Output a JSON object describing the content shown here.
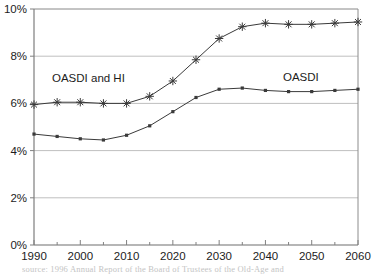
{
  "chart_data": {
    "type": "line",
    "title": "",
    "subtitle": "",
    "xlabel": "",
    "ylabel": "",
    "xlim": [
      1990,
      2060
    ],
    "ylim": [
      0,
      10
    ],
    "grid": true,
    "grid_axis": "y",
    "legend": "inline-annotations",
    "x": [
      1990,
      1995,
      2000,
      2005,
      2010,
      2015,
      2020,
      2025,
      2030,
      2035,
      2040,
      2045,
      2050,
      2055,
      2060
    ],
    "series": [
      {
        "name": "OASDI and HI",
        "marker": "star",
        "values": [
          5.95,
          6.05,
          6.05,
          6.0,
          6.0,
          6.3,
          6.95,
          7.85,
          8.75,
          9.25,
          9.4,
          9.35,
          9.35,
          9.4,
          9.45
        ]
      },
      {
        "name": "OASDI",
        "marker": "square",
        "values": [
          4.7,
          4.6,
          4.5,
          4.45,
          4.65,
          5.05,
          5.65,
          6.25,
          6.6,
          6.65,
          6.55,
          6.5,
          6.5,
          6.55,
          6.6
        ]
      }
    ],
    "y_ticks": [
      {
        "value": 0,
        "label": "0%"
      },
      {
        "value": 2,
        "label": "2%"
      },
      {
        "value": 4,
        "label": "4%"
      },
      {
        "value": 6,
        "label": "6%"
      },
      {
        "value": 8,
        "label": "8%"
      },
      {
        "value": 10,
        "label": "10%"
      }
    ],
    "x_ticks": [
      {
        "value": 1990,
        "label": "1990"
      },
      {
        "value": 2000,
        "label": "2000"
      },
      {
        "value": 2010,
        "label": "2010"
      },
      {
        "value": 2020,
        "label": "2020"
      },
      {
        "value": 2030,
        "label": "2030"
      },
      {
        "value": 2040,
        "label": "2040"
      },
      {
        "value": 2050,
        "label": "2050"
      },
      {
        "value": 2060,
        "label": "2060"
      }
    ],
    "x_minor_ticks": [
      1995,
      2005,
      2015,
      2025,
      2035,
      2045,
      2055
    ],
    "annotations": [
      {
        "text": "OASDI and HI",
        "x_px": 52,
        "y_px": 82
      },
      {
        "text": "OASDI",
        "x_px": 283,
        "y_px": 81
      }
    ],
    "colors": {
      "line": "#3a3a3a",
      "grid": "#bfbfbf",
      "axis": "#808080",
      "text": "#1c1c1c",
      "background": "#ffffff"
    }
  },
  "caption": {
    "cut_off_line": "source:   1996 Annual Report of the Board of Trustees of the Old-Age and"
  }
}
